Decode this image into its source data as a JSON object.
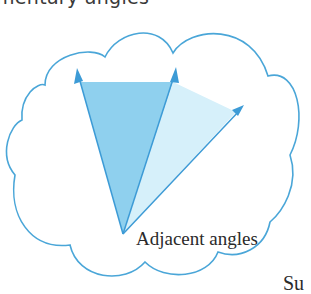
{
  "header": {
    "partial_title": "mentary angles"
  },
  "diagram": {
    "label": "Adjacent angles",
    "colors": {
      "cloud_outline": "#4aa6d8",
      "ray": "#3d9bd6",
      "angle_1_fill": "#8fd0ee",
      "angle_2_fill": "#d6f0fa"
    }
  },
  "footer": {
    "partial_text": "Su"
  }
}
